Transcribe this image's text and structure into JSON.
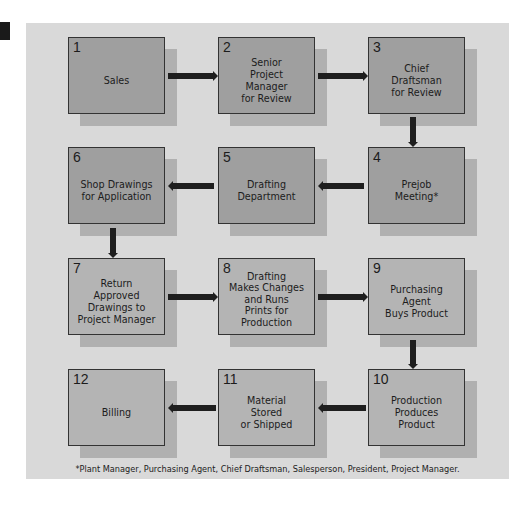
{
  "diagram": {
    "type": "flowchart",
    "colors": {
      "panel": "#d9d9d9",
      "box_dark": "#9f9f9f",
      "box_light": "#b4b4b4",
      "shadow": "#b0b0b0",
      "arrow": "#1e1e1e",
      "border": "#333333"
    },
    "steps": [
      {
        "num": "1",
        "label": "Sales"
      },
      {
        "num": "2",
        "label": "Senior\nProject\nManager\nfor Review"
      },
      {
        "num": "3",
        "label": "Chief\nDraftsman\nfor Review"
      },
      {
        "num": "4",
        "label": "Prejob\nMeeting*"
      },
      {
        "num": "5",
        "label": "Drafting\nDepartment"
      },
      {
        "num": "6",
        "label": "Shop Drawings\nfor Application"
      },
      {
        "num": "7",
        "label": "Return\nApproved\nDrawings to\nProject Manager"
      },
      {
        "num": "8",
        "label": "Drafting\nMakes Changes\nand Runs\nPrints for\nProduction"
      },
      {
        "num": "9",
        "label": "Purchasing\nAgent\nBuys Product"
      },
      {
        "num": "10",
        "label": "Production\nProduces\nProduct"
      },
      {
        "num": "11",
        "label": "Material\nStored\nor Shipped"
      },
      {
        "num": "12",
        "label": "Billing"
      }
    ],
    "flow": [
      [
        "1",
        "2"
      ],
      [
        "2",
        "3"
      ],
      [
        "3",
        "4"
      ],
      [
        "4",
        "5"
      ],
      [
        "5",
        "6"
      ],
      [
        "6",
        "7"
      ],
      [
        "7",
        "8"
      ],
      [
        "8",
        "9"
      ],
      [
        "9",
        "10"
      ],
      [
        "10",
        "11"
      ],
      [
        "11",
        "12"
      ]
    ],
    "footnote": "*Plant Manager, Purchasing Agent, Chief Draftsman, Salesperson, President, Project Manager."
  }
}
